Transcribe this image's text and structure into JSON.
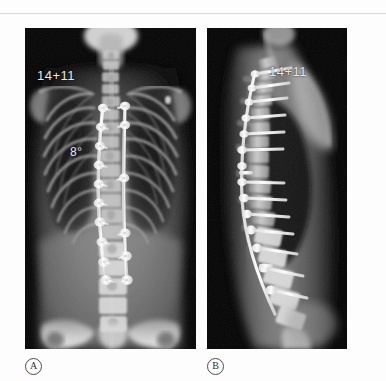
{
  "figure": {
    "type": "radiograph-figure",
    "background_color": "#fdfdfd",
    "panel_background_color": "#000000",
    "overlay_text_color": "#e8e8e8",
    "caption_text_color": "#303030"
  },
  "panels": [
    {
      "id": "A",
      "caption_label": "A",
      "view": "posteroanterior",
      "annotations": {
        "age_label": "14+11",
        "angle_label": "8°"
      }
    },
    {
      "id": "B",
      "caption_label": "B",
      "view": "lateral",
      "annotations": {
        "age_label": "14+11"
      }
    }
  ]
}
